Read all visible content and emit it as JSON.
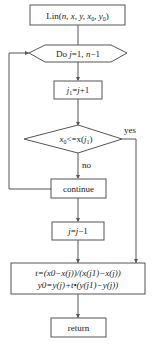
{
  "diagram": {
    "type": "flowchart",
    "nodes": {
      "start": {
        "shape": "rect",
        "label": "Lin(n, x, y, x0, y0)",
        "text_main": "Lin(",
        "args": "n, x, y, x",
        "sub0": "0",
        "sep": ", y",
        "sub1": "0",
        "close": ")"
      },
      "loop": {
        "shape": "hexagon",
        "label": "Do j=1, n−1",
        "do": "Do ",
        "var": "j",
        "range": "=1, ",
        "n": "n",
        "minus": "−1"
      },
      "assign": {
        "shape": "rect",
        "label": "j1=j+1",
        "j": "j",
        "sub": "1",
        "eq": "=",
        "j2": "j",
        "plus": "+1"
      },
      "decision": {
        "shape": "diamond",
        "label": "x0<=x(j1)",
        "x": "x",
        "sub0": "0",
        "op": "<=x(",
        "j": "j",
        "sub1": "1",
        "close": ")"
      },
      "continue": {
        "shape": "rect",
        "label": "continue"
      },
      "decrement": {
        "shape": "rect",
        "label": "j=j−1",
        "j": "j",
        "eq": "=",
        "j2": "j",
        "minus": "−1"
      },
      "compute": {
        "shape": "rect",
        "line1": "t=(x0−x(j))/(x(j1)−x(j))",
        "line2": "y0=y(j)+t•(y(j1)−y(j))"
      },
      "return": {
        "shape": "rect",
        "label": "return"
      }
    },
    "edge_labels": {
      "yes": "yes",
      "no": "no"
    },
    "edges": [
      {
        "from": "start",
        "to": "loop"
      },
      {
        "from": "loop",
        "to": "assign"
      },
      {
        "from": "assign",
        "to": "decision"
      },
      {
        "from": "decision",
        "to": "continue",
        "label": "no"
      },
      {
        "from": "decision",
        "to": "compute",
        "label": "yes"
      },
      {
        "from": "continue",
        "to": "loop",
        "type": "loop-back"
      },
      {
        "from": "continue",
        "to": "decrement"
      },
      {
        "from": "decrement",
        "to": "compute"
      },
      {
        "from": "compute",
        "to": "return"
      }
    ],
    "colors": {
      "stroke": "#555555",
      "text": "#222222",
      "background": "#ffffff"
    }
  }
}
